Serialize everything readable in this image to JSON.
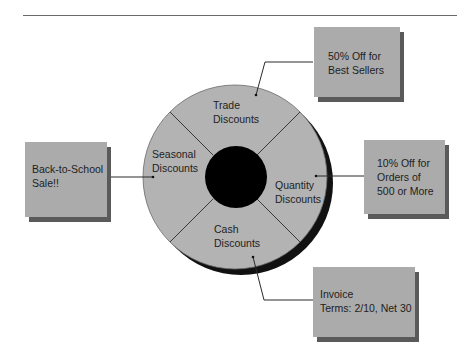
{
  "diagram": {
    "type": "wheel-diagram",
    "hub_color": "#000000",
    "wheel_color": "#b3b3b3",
    "box_color": "#ababab",
    "shadow_color": "#5a5a5a",
    "segments": [
      {
        "id": "trade",
        "line1": "Trade",
        "line2": "Discounts"
      },
      {
        "id": "quantity",
        "line1": "Quantity",
        "line2": "Discounts"
      },
      {
        "id": "cash",
        "line1": "Cash",
        "line2": "Discounts"
      },
      {
        "id": "seasonal",
        "line1": "Seasonal",
        "line2": "Discounts"
      }
    ],
    "callouts": [
      {
        "id": "trade",
        "lines": [
          "50% Off for",
          "Best Sellers"
        ]
      },
      {
        "id": "quantity",
        "lines": [
          "10% Off for",
          "Orders of",
          "500 or More"
        ]
      },
      {
        "id": "cash",
        "lines": [
          "Invoice",
          "Terms: 2/10, Net 30"
        ]
      },
      {
        "id": "seasonal",
        "lines": [
          "Back-to-School",
          "Sale!!"
        ]
      }
    ]
  }
}
